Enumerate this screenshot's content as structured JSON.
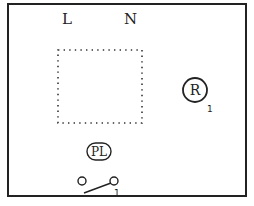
{
  "diagram": {
    "terminals": {
      "line_label": "L",
      "neutral_label": "N"
    },
    "components": [
      {
        "id": "relay",
        "label": "R",
        "marker": "1",
        "shape": "circle"
      },
      {
        "id": "pilot_lamp",
        "label": "PL",
        "shape": "rounded-capsule"
      },
      {
        "id": "switch",
        "label": "",
        "marker": "1",
        "shape": "switch"
      }
    ],
    "placeholder_box": {
      "style": "dotted"
    },
    "colors": {
      "stroke": "#222222",
      "background": "#ffffff"
    }
  }
}
